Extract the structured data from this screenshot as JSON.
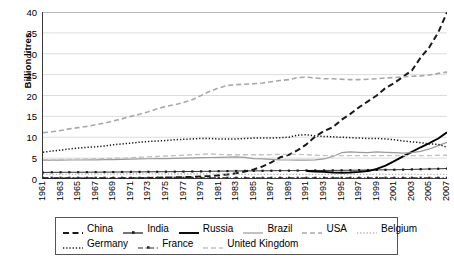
{
  "chart_data": {
    "type": "line",
    "title": "",
    "xlabel": "",
    "ylabel": "Billion litres",
    "ylim": [
      0,
      40
    ],
    "yticks": [
      0,
      5,
      10,
      15,
      20,
      25,
      30,
      35,
      40
    ],
    "xlim": [
      1961,
      2007
    ],
    "grid": true,
    "legend_position": "bottom",
    "x": [
      1961,
      1962,
      1963,
      1964,
      1965,
      1966,
      1967,
      1968,
      1969,
      1970,
      1971,
      1972,
      1973,
      1974,
      1975,
      1976,
      1977,
      1978,
      1979,
      1980,
      1981,
      1982,
      1983,
      1984,
      1985,
      1986,
      1987,
      1988,
      1989,
      1990,
      1991,
      1992,
      1993,
      1994,
      1995,
      1996,
      1997,
      1998,
      1999,
      2000,
      2001,
      2002,
      2003,
      2004,
      2005,
      2006,
      2007
    ],
    "tick_labels": [
      "1961",
      "1963",
      "1965",
      "1967",
      "1969",
      "1971",
      "1973",
      "1975",
      "1977",
      "1979",
      "1981",
      "1983",
      "1985",
      "1987",
      "1989",
      "1991",
      "1993",
      "1995",
      "1997",
      "1999",
      "2001",
      "2003",
      "2005",
      "2007"
    ],
    "series": [
      {
        "name": "China",
        "style": "dashed",
        "color": "#1a1a1a",
        "width": 2.0,
        "marker": "none",
        "values": [
          0.1,
          0.1,
          0.1,
          0.1,
          0.1,
          0.1,
          0.1,
          0.1,
          0.1,
          0.15,
          0.2,
          0.2,
          0.25,
          0.3,
          0.35,
          0.4,
          0.45,
          0.5,
          0.6,
          0.7,
          0.9,
          1.1,
          1.4,
          1.8,
          2.3,
          3.0,
          4.0,
          5.2,
          5.8,
          6.9,
          8.3,
          10.2,
          11.5,
          12.4,
          14.2,
          15.6,
          17.2,
          18.6,
          20.0,
          21.8,
          23.0,
          24.5,
          26.0,
          29.1,
          31.6,
          35.1,
          39.9
        ]
      },
      {
        "name": "India",
        "style": "solid",
        "color": "#1a1a1a",
        "width": 0.9,
        "marker": "dot",
        "values": [
          1.55,
          1.6,
          1.6,
          1.62,
          1.62,
          1.63,
          1.65,
          1.65,
          1.66,
          1.68,
          1.7,
          1.7,
          1.72,
          1.73,
          1.75,
          1.76,
          1.78,
          1.8,
          1.82,
          1.85,
          1.88,
          1.9,
          1.92,
          1.95,
          1.95,
          1.96,
          1.98,
          2.0,
          2.0,
          2.02,
          2.05,
          2.05,
          2.05,
          2.06,
          2.08,
          2.1,
          2.12,
          2.15,
          2.18,
          2.2,
          2.22,
          2.25,
          2.3,
          2.35,
          2.4,
          2.45,
          2.5
        ]
      },
      {
        "name": "Russia",
        "style": "solid",
        "color": "#000000",
        "width": 1.9,
        "marker": "none",
        "values": [
          null,
          null,
          null,
          null,
          null,
          null,
          null,
          null,
          null,
          null,
          null,
          null,
          null,
          null,
          null,
          null,
          null,
          null,
          null,
          null,
          null,
          null,
          null,
          null,
          null,
          null,
          null,
          null,
          null,
          null,
          1.9,
          1.8,
          1.7,
          1.55,
          1.5,
          1.55,
          1.7,
          1.9,
          2.4,
          3.2,
          4.3,
          5.4,
          6.5,
          7.6,
          8.6,
          9.7,
          11.2
        ]
      },
      {
        "name": "Brazil",
        "style": "solid",
        "color": "#9a9a9a",
        "width": 1.2,
        "marker": "none",
        "values": [
          4.45,
          4.5,
          4.52,
          4.55,
          4.55,
          4.58,
          4.6,
          4.62,
          4.65,
          4.7,
          4.75,
          4.8,
          4.85,
          4.88,
          4.9,
          4.95,
          5.0,
          5.05,
          5.1,
          5.15,
          5.2,
          5.25,
          5.3,
          5.2,
          4.9,
          4.8,
          4.7,
          4.6,
          4.55,
          4.5,
          4.5,
          4.6,
          4.8,
          5.4,
          6.3,
          6.5,
          6.4,
          6.3,
          6.5,
          6.4,
          6.3,
          6.2,
          6.3,
          6.6,
          7.2,
          8.0,
          8.8
        ]
      },
      {
        "name": "USA",
        "style": "dashed",
        "color": "#a8a8a8",
        "width": 1.6,
        "marker": "none",
        "values": [
          11.1,
          11.3,
          11.6,
          12.0,
          12.3,
          12.6,
          13.0,
          13.4,
          13.9,
          14.4,
          15.0,
          15.5,
          16.1,
          16.8,
          17.4,
          17.8,
          18.3,
          19.0,
          20.0,
          21.0,
          21.8,
          22.4,
          22.6,
          22.7,
          22.8,
          23.0,
          23.3,
          23.6,
          23.8,
          24.3,
          24.4,
          24.2,
          24.0,
          24.0,
          23.9,
          23.8,
          23.8,
          23.9,
          24.0,
          24.2,
          24.3,
          24.5,
          24.6,
          24.7,
          24.9,
          25.3,
          25.6
        ]
      },
      {
        "name": "Belgium",
        "style": "dotted",
        "color": "#b5b5b5",
        "width": 1.3,
        "marker": "none",
        "values": [
          1.1,
          1.1,
          1.12,
          1.12,
          1.14,
          1.15,
          1.15,
          1.16,
          1.17,
          1.18,
          1.2,
          1.2,
          1.22,
          1.22,
          1.2,
          1.2,
          1.2,
          1.2,
          1.2,
          1.2,
          1.18,
          1.15,
          1.14,
          1.12,
          1.12,
          1.1,
          1.1,
          1.1,
          1.1,
          1.1,
          1.1,
          1.1,
          1.1,
          1.1,
          1.1,
          1.1,
          1.1,
          1.1,
          1.1,
          1.1,
          1.1,
          1.1,
          1.1,
          1.1,
          1.1,
          1.1,
          1.1
        ]
      },
      {
        "name": "Germany",
        "style": "dotted",
        "color": "#1a1a1a",
        "width": 1.5,
        "marker": "none",
        "values": [
          6.4,
          6.7,
          6.9,
          7.2,
          7.4,
          7.6,
          7.7,
          7.9,
          8.2,
          8.4,
          8.6,
          8.8,
          9.0,
          9.1,
          9.2,
          9.4,
          9.5,
          9.6,
          9.7,
          9.7,
          9.6,
          9.6,
          9.6,
          9.7,
          9.8,
          9.8,
          9.8,
          9.9,
          10.0,
          10.5,
          10.6,
          10.3,
          10.2,
          10.1,
          10.0,
          9.9,
          9.8,
          9.7,
          9.7,
          9.6,
          9.4,
          9.1,
          8.9,
          8.7,
          8.4,
          8.3,
          7.6
        ]
      },
      {
        "name": "France",
        "style": "dashdot",
        "color": "#2a2a2a",
        "width": 1.1,
        "marker": "dot",
        "values": [
          0.3,
          0.3,
          0.3,
          0.3,
          0.3,
          0.3,
          0.3,
          0.3,
          0.3,
          0.3,
          0.3,
          0.3,
          0.3,
          0.3,
          0.3,
          0.3,
          0.3,
          0.3,
          0.3,
          0.3,
          0.3,
          0.3,
          0.3,
          0.3,
          0.3,
          0.3,
          0.3,
          0.3,
          0.3,
          0.3,
          0.3,
          0.3,
          0.3,
          0.3,
          0.3,
          0.3,
          0.3,
          0.3,
          0.3,
          0.3,
          0.3,
          0.3,
          0.3,
          0.3,
          0.3,
          0.3,
          0.3
        ]
      },
      {
        "name": "United Kingdom",
        "style": "dashed",
        "color": "#c2c2c2",
        "width": 1.4,
        "marker": "none",
        "values": [
          4.6,
          4.6,
          4.7,
          4.7,
          4.75,
          4.8,
          4.85,
          4.9,
          4.95,
          5.0,
          5.1,
          5.2,
          5.3,
          5.4,
          5.5,
          5.6,
          5.7,
          5.8,
          5.9,
          6.0,
          5.9,
          5.8,
          5.8,
          5.8,
          5.8,
          5.8,
          5.85,
          5.9,
          5.9,
          5.9,
          5.8,
          5.7,
          5.6,
          5.6,
          5.6,
          5.6,
          5.6,
          5.6,
          5.6,
          5.6,
          5.6,
          5.6,
          5.6,
          5.6,
          5.6,
          5.7,
          5.7
        ]
      }
    ],
    "legend_rows": [
      [
        "China",
        "India",
        "Russia",
        "Brazil",
        "USA",
        "Belgium"
      ],
      [
        "Germany",
        "France",
        "United Kingdom"
      ]
    ]
  }
}
